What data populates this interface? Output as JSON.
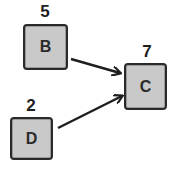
{
  "diagram": {
    "type": "directed-graph",
    "nodes": [
      {
        "id": "B",
        "label": "B",
        "value": "5"
      },
      {
        "id": "C",
        "label": "C",
        "value": "7"
      },
      {
        "id": "D",
        "label": "D",
        "value": "2"
      }
    ],
    "edges": [
      {
        "from": "B",
        "to": "C"
      },
      {
        "from": "D",
        "to": "C"
      }
    ],
    "colors": {
      "node_fill": "#c9c9c9",
      "node_border": "#2a2a2a",
      "edge": "#1e1e1e",
      "text": "#1e1e1e"
    }
  }
}
